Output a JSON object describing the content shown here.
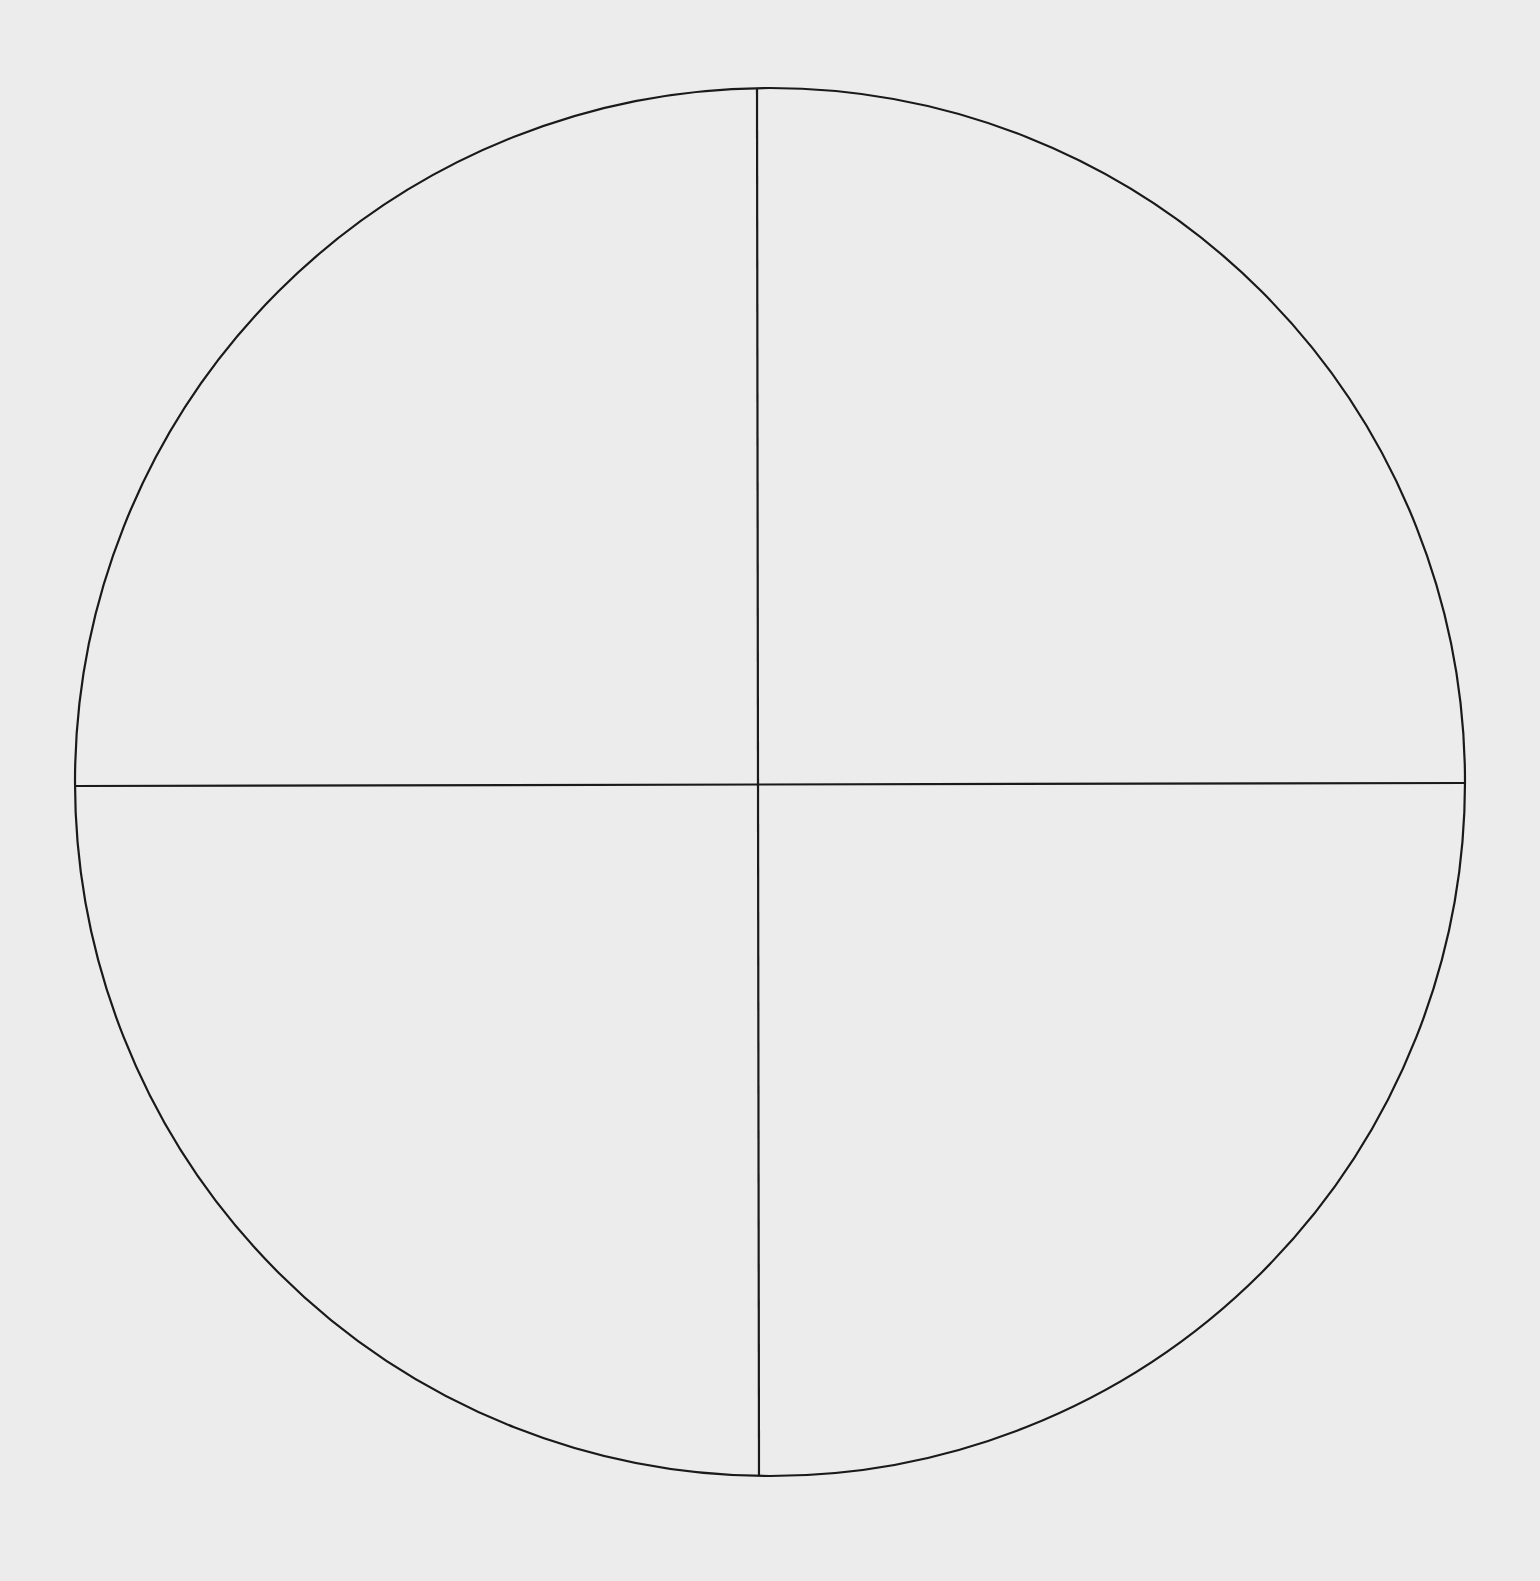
{
  "diagram": {
    "background_color": "#ececec",
    "stroke_color": "#1a1a1a",
    "stroke_width": 2.2,
    "circle": {
      "cx": 770,
      "cy": 782,
      "rx": 695,
      "ry": 694
    },
    "vertical_divider": {
      "x1": 757,
      "y1": 88,
      "x2": 759,
      "y2": 1476
    },
    "horizontal_divider": {
      "x1": 75,
      "y1": 786,
      "x2": 1465,
      "y2": 783
    },
    "quadrants": [
      "top-left",
      "top-right",
      "bottom-left",
      "bottom-right"
    ]
  }
}
